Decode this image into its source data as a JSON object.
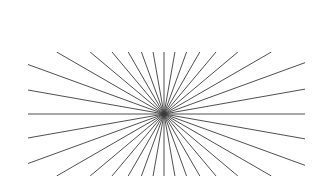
{
  "page": {
    "background_color": "#ffffff",
    "width": 331,
    "height": 195
  },
  "figure": {
    "name": "radial-sunburst-illusion",
    "line_color": "#3c3c3c",
    "line_width": 0.9,
    "background_color": "#ffffff",
    "caption": ""
  },
  "chart_data": {
    "type": "line",
    "title": "",
    "subtitle": "",
    "xlabel": "",
    "ylabel": "",
    "grid": false,
    "legend": "none",
    "xlim": [
      0,
      331
    ],
    "ylim": [
      0,
      195
    ],
    "center": {
      "x": 164,
      "y": 114
    },
    "frame": {
      "left": 28,
      "top": 52,
      "right": 305,
      "bottom": 176
    },
    "ray_count": 36,
    "ray_angles_deg": [
      0,
      10,
      20,
      30,
      40,
      50,
      60,
      70,
      80,
      90,
      100,
      110,
      120,
      130,
      140,
      150,
      160,
      170,
      180,
      190,
      200,
      210,
      220,
      230,
      240,
      250,
      260,
      270,
      280,
      290,
      300,
      310,
      320,
      330,
      340,
      350
    ],
    "series": [
      {
        "name": "rays",
        "values": [
          0,
          10,
          20,
          30,
          40,
          50,
          60,
          70,
          80,
          90,
          100,
          110,
          120,
          130,
          140,
          150,
          160,
          170,
          180,
          190,
          200,
          210,
          220,
          230,
          240,
          250,
          260,
          270,
          280,
          290,
          300,
          310,
          320,
          330,
          340,
          350
        ]
      }
    ]
  }
}
